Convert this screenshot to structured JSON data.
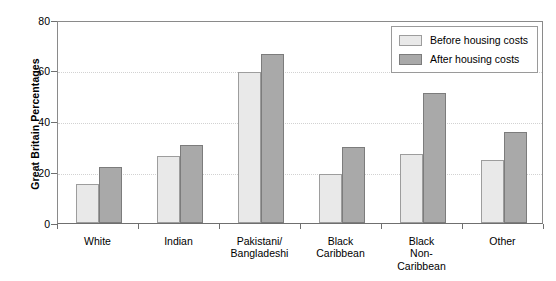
{
  "chart_data": {
    "type": "bar",
    "title": "",
    "xlabel": "",
    "ylabel": "Great Britain Percentages",
    "ylim": [
      0,
      80
    ],
    "yticks": [
      0,
      20,
      40,
      60,
      80
    ],
    "grid": true,
    "legend_position": "top-right",
    "categories": [
      "White",
      "Indian",
      "Pakistani/\nBangladeshi",
      "Black\nCaribbean",
      "Black\nNon-\nCaribbean",
      "Other"
    ],
    "series": [
      {
        "name": "Before housing costs",
        "color": "#e9e9e9",
        "values": [
          15.4,
          26.4,
          59.5,
          19.5,
          27.2,
          25.0
        ]
      },
      {
        "name": "After housing costs",
        "color": "#a9a9a9",
        "values": [
          22.0,
          30.7,
          66.5,
          30.0,
          51.3,
          36.0
        ]
      }
    ]
  },
  "axis": {
    "y_title": "Great Britain Percentages",
    "y_tick_labels": [
      "80",
      "60",
      "40",
      "20",
      "0"
    ],
    "x_tick_labels": [
      [
        "White"
      ],
      [
        "Indian"
      ],
      [
        "Pakistani/",
        "Bangladeshi"
      ],
      [
        "Black",
        "Caribbean"
      ],
      [
        "Black",
        "Non-",
        "Caribbean"
      ],
      [
        "Other"
      ]
    ]
  },
  "legend": {
    "items": [
      {
        "label": "Before housing costs",
        "swatch": "before"
      },
      {
        "label": "After housing costs",
        "swatch": "after"
      }
    ]
  }
}
